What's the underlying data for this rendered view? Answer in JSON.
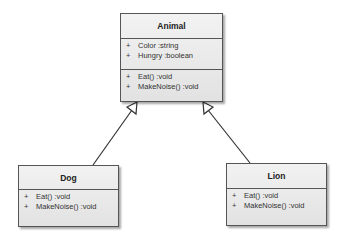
{
  "classes": {
    "animal": {
      "name": "Animal",
      "attributes": [
        {
          "visibility": "+",
          "text": "Color  :string"
        },
        {
          "visibility": "+",
          "text": "Hungry  :boolean"
        }
      ],
      "operations": [
        {
          "visibility": "+",
          "text": "Eat()  :void"
        },
        {
          "visibility": "+",
          "text": "MakeNoise()  :void"
        }
      ]
    },
    "dog": {
      "name": "Dog",
      "operations": [
        {
          "visibility": "+",
          "text": "Eat()  :void"
        },
        {
          "visibility": "+",
          "text": "MakeNoise()  :void"
        }
      ]
    },
    "lion": {
      "name": "Lion",
      "operations": [
        {
          "visibility": "+",
          "text": "Eat()  :void"
        },
        {
          "visibility": "+",
          "text": "MakeNoise()  :void"
        }
      ]
    }
  },
  "relations": [
    {
      "type": "generalization",
      "from": "Dog",
      "to": "Animal"
    },
    {
      "type": "generalization",
      "from": "Lion",
      "to": "Animal"
    }
  ]
}
